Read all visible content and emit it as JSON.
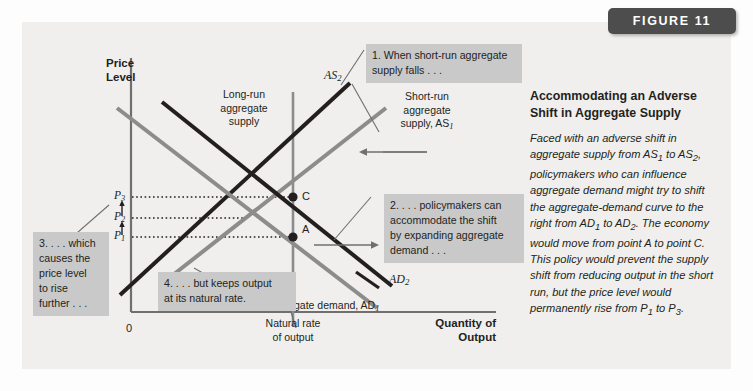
{
  "figure_tab": {
    "label": "FIGURE 11"
  },
  "caption": {
    "title": "Accommodating an Adverse Shift in Aggregate Supply",
    "body_html": "Faced with an adverse shift in aggregate supply from AS<sub>1</sub> to AS<sub>2</sub>, policymakers who can influence aggregate demand might try to shift the aggregate-demand curve to the right from AD<sub>1</sub> to AD<sub>2</sub>. The economy would move from point A to point C. This policy would prevent the supply shift from reducing output in the short run, but the price level would permanently rise from P<sub>1</sub> to P<sub>3</sub>."
  },
  "chart_data": {
    "type": "line",
    "title": "Accommodating an Adverse Shift in Aggregate Supply",
    "xlabel": "Quantity of Output",
    "ylabel": "Price Level",
    "origin_label": "0",
    "grid": false,
    "x_tick_labels": [
      "Natural rate of output"
    ],
    "y_tick_labels": [
      "P1",
      "P2",
      "P3"
    ],
    "series": [
      {
        "name": "Long-run aggregate supply",
        "type": "vertical-line",
        "color": "#8c8c8c",
        "x": "natural rate of output"
      },
      {
        "name": "AS1",
        "label": "Short-run aggregate supply, AS1",
        "type": "upward-sloping",
        "color": "#8c8c8c"
      },
      {
        "name": "AS2",
        "label": "AS2",
        "type": "upward-sloping",
        "color": "#231f20",
        "shift": "leftward / upward"
      },
      {
        "name": "AD1",
        "label": "Aggregate demand, AD1",
        "type": "downward-sloping",
        "color": "#8c8c8c"
      },
      {
        "name": "AD2",
        "label": "AD2",
        "type": "downward-sloping",
        "color": "#231f20",
        "shift": "rightward"
      }
    ],
    "points": [
      {
        "label": "A",
        "description": "initial equilibrium: AS1 x AD1 at natural rate, price P1"
      },
      {
        "label": "C",
        "description": "new equilibrium: AS2 x AD2 at natural rate, price P3"
      }
    ],
    "annotations": [
      "1. When short-run aggregate supply falls . . .",
      "2. . . . policymakers can accommodate the shift by expanding aggregate demand . . .",
      "3. . . . which causes the price level to rise further . . .",
      "4. . . . but keeps output at its natural rate."
    ]
  },
  "axes": {
    "y_title_line1": "Price",
    "y_title_line2": "Level",
    "x_title_line1": "Quantity of",
    "x_title_line2": "Output",
    "origin": "0",
    "x_tick_line1": "Natural rate",
    "x_tick_line2": "of output"
  },
  "price_labels": {
    "p3": "P",
    "p3_sub": "3",
    "p2": "P",
    "p2_sub": "2",
    "p1": "P",
    "p1_sub": "1"
  },
  "points": {
    "a": "A",
    "c": "C"
  },
  "curve_labels": {
    "lras_line1": "Long-run",
    "lras_line2": "aggregate",
    "lras_line3": "supply",
    "as2": "AS",
    "as2_sub": "2",
    "sras_line1": "Short-run",
    "sras_line2": "aggregate",
    "sras_line3": "supply, AS",
    "sras_sub": "1",
    "ad2": "AD",
    "ad2_sub": "2",
    "ad1": "Aggregate demand, AD",
    "ad1_sub": "1"
  },
  "callouts": {
    "one_line1": "1. When short-run aggregate",
    "one_line2": "supply falls . . .",
    "two_line1": "2. . . . policymakers can",
    "two_line2": "accommodate the shift",
    "two_line3": "by expanding aggregate",
    "two_line4": "demand . . .",
    "three_line1": "3. . . . which",
    "three_line2": "causes the",
    "three_line3": "price level",
    "three_line4": "to rise",
    "three_line5": "further . . .",
    "four_line1": "4. . . . but keeps output",
    "four_line2": "at its natural rate."
  },
  "colors": {
    "dark_curve": "#231f20",
    "gray_curve": "#8c8c8c",
    "panel": "#f0efed",
    "callout": "#c9c9c9",
    "tab": "#4d4d4d"
  }
}
